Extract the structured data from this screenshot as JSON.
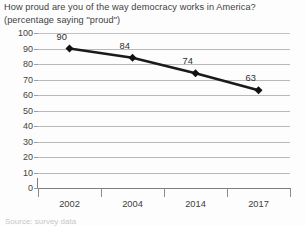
{
  "chart_data": {
    "type": "line",
    "title": "How proud are you of the way democracy works in America?",
    "subtitle": "(percentage saying \"proud\")",
    "title_lines": [
      "How proud are you of the way democracy works in America?",
      "(percentage saying \"proud\")"
    ],
    "categories": [
      "2002",
      "2004",
      "2014",
      "2017"
    ],
    "values": [
      90,
      84,
      74,
      63
    ],
    "point_labels": [
      "90",
      "84",
      "74",
      "63"
    ],
    "xlabel": "",
    "ylabel": "",
    "ylim": [
      0,
      100
    ],
    "ytick_labels": [
      "100",
      "90",
      "80",
      "70",
      "60",
      "50",
      "40",
      "30",
      "20",
      "10",
      "0"
    ],
    "ytick_values": [
      100,
      90,
      80,
      70,
      60,
      50,
      40,
      30,
      20,
      10,
      0
    ],
    "grid": "horizontal",
    "legend": "none",
    "series": [
      {
        "name": "percentage saying proud",
        "values": [
          90,
          84,
          74,
          63
        ],
        "marker": "diamond",
        "color": "#1a1a1a"
      }
    ],
    "colors": {
      "line": "#1a1a1a",
      "marker": "#111111",
      "gridline": "#b9b9b9",
      "axis": "#7e7e7e",
      "text": "#3d3d3b",
      "background": "#fdfdfd"
    }
  },
  "footnote": {
    "clipped_text": "Source: survey data"
  }
}
